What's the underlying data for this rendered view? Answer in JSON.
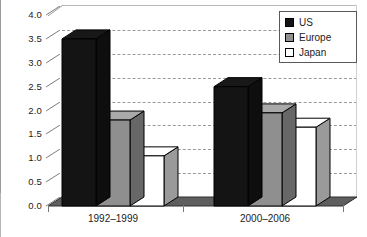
{
  "chart_data": {
    "type": "bar",
    "title": "",
    "subtitle": "",
    "xlabel": "",
    "ylabel": "",
    "categories": [
      "1992–1999",
      "2000–2006"
    ],
    "series": [
      {
        "name": "US",
        "color": "#141414",
        "values": [
          3.5,
          2.5
        ]
      },
      {
        "name": "Europe",
        "color": "#8f8f8f",
        "values": [
          1.8,
          1.95
        ]
      },
      {
        "name": "Japan",
        "color": "#ffffff",
        "values": [
          1.05,
          1.65
        ]
      }
    ],
    "ylim": [
      0.0,
      4.0
    ],
    "ytick_labels": [
      "4.0",
      "3.5",
      "3.0",
      "2.5",
      "2.0",
      "1.5",
      "1.0",
      "0.5",
      "0.0"
    ],
    "ytick_values": [
      4.0,
      3.5,
      3.0,
      2.5,
      2.0,
      1.5,
      1.0,
      0.5,
      0.0
    ],
    "ytick_step": 0.5,
    "grid": true,
    "grid_style": "dashed",
    "grid_axis": "y",
    "legend_position": "top-right",
    "style_3d": true
  },
  "legend": {
    "items": [
      {
        "label": "US",
        "swatch": "black-square-icon"
      },
      {
        "label": "Europe",
        "swatch": "gray-square-icon"
      },
      {
        "label": "Japan",
        "swatch": "white-square-icon"
      }
    ]
  },
  "axes": {
    "y_labels": [
      "4.0",
      "3.5",
      "3.0",
      "2.5",
      "2.0",
      "1.5",
      "1.0",
      "0.5",
      "0.0"
    ],
    "x_labels": [
      "1992–1999",
      "2000–2006"
    ]
  }
}
